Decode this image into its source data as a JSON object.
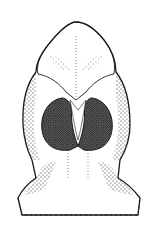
{
  "figure": {
    "type": "stippled line drawing",
    "colors": {
      "background": "#ffffff",
      "ink": "#1a1a1a"
    }
  }
}
